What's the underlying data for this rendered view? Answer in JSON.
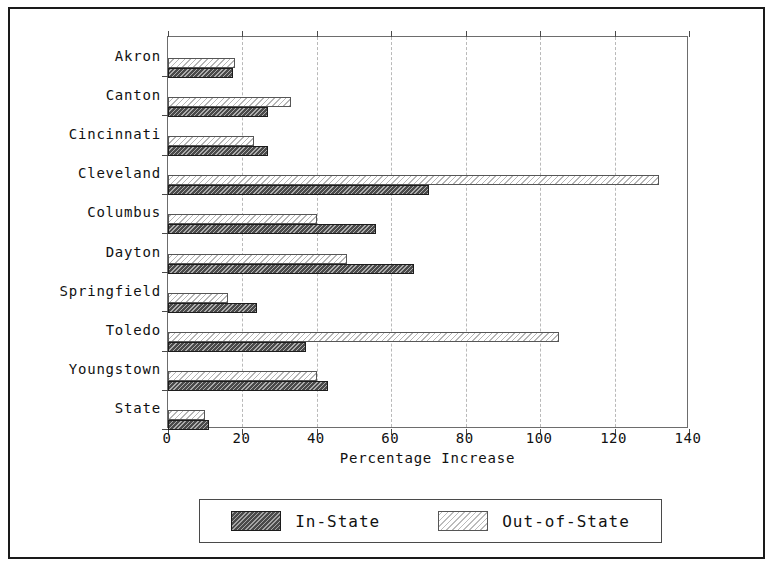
{
  "chart_data": {
    "type": "bar",
    "orientation": "horizontal",
    "title": "",
    "xlabel": "Percentage Increase",
    "ylabel": "",
    "xlim": [
      0,
      140
    ],
    "xticks": [
      0,
      20,
      40,
      60,
      80,
      100,
      120,
      140
    ],
    "grid": true,
    "legend_position": "bottom",
    "categories": [
      "Akron",
      "Canton",
      "Cincinnati",
      "Cleveland",
      "Columbus",
      "Dayton",
      "Springfield",
      "Toledo",
      "Youngstown",
      "State"
    ],
    "series": [
      {
        "name": "In-State",
        "color": "#4a4a4a",
        "pattern": "dense-diagonal-hatch",
        "values": [
          17.5,
          27,
          27,
          70,
          56,
          66,
          24,
          37,
          43,
          11
        ]
      },
      {
        "name": "Out-of-State",
        "color": "#ffffff",
        "pattern": "light-diagonal-hatch",
        "values": [
          18,
          33,
          23,
          132,
          40,
          48,
          16,
          105,
          40,
          10
        ]
      }
    ]
  },
  "axis": {
    "x_title": "Percentage Increase",
    "tick_labels": [
      "0",
      "20",
      "40",
      "60",
      "80",
      "100",
      "120",
      "140"
    ]
  },
  "legend": {
    "entries": [
      {
        "label": "In-State"
      },
      {
        "label": "Out-of-State"
      }
    ]
  }
}
